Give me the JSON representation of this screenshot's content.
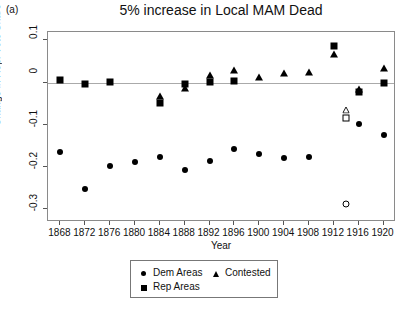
{
  "panel_label": "(a)",
  "chart_data": {
    "type": "scatter",
    "title": "5% increase in Local MAM Dead",
    "xlabel": "Year",
    "ylabel": "Change in Rep. Vote Share",
    "xlim": [
      1866,
      1922
    ],
    "ylim": [
      -0.33,
      0.12
    ],
    "xticks": [
      1868,
      1872,
      1876,
      1880,
      1884,
      1888,
      1892,
      1896,
      1900,
      1904,
      1908,
      1912,
      1916,
      1920
    ],
    "yticks": [
      0.1,
      0,
      -0.1,
      -0.2,
      -0.3
    ],
    "ytick_labels": [
      "0.1",
      "0",
      "-0.1",
      "-0.2",
      "-0.3"
    ],
    "grid": false,
    "zero_reference_line": 0,
    "legend_position": "bottom-center",
    "series": [
      {
        "name": "Dem Areas",
        "marker": "circle",
        "filled": true,
        "color": "#000000",
        "x": [
          1868,
          1872,
          1876,
          1880,
          1884,
          1888,
          1892,
          1896,
          1900,
          1904,
          1908,
          1916,
          1920
        ],
        "y": [
          -0.165,
          -0.253,
          -0.198,
          -0.188,
          -0.175,
          -0.207,
          -0.185,
          -0.157,
          -0.168,
          -0.178,
          -0.177,
          -0.098,
          -0.123
        ]
      },
      {
        "name": "Rep Areas",
        "marker": "square",
        "filled": true,
        "color": "#000000",
        "x": [
          1868,
          1872,
          1876,
          1884,
          1888,
          1892,
          1896,
          1912,
          1916,
          1920
        ],
        "y": [
          0.006,
          -0.003,
          0.002,
          -0.047,
          -0.003,
          0.001,
          0.005,
          0.088,
          -0.023,
          0.0
        ]
      },
      {
        "name": "Contested",
        "marker": "triangle",
        "filled": true,
        "color": "#000000",
        "x": [
          1884,
          1888,
          1892,
          1896,
          1900,
          1904,
          1908,
          1912,
          1916,
          1920
        ],
        "y": [
          -0.032,
          -0.012,
          0.018,
          0.031,
          0.014,
          0.024,
          0.026,
          0.068,
          -0.014,
          0.035
        ]
      },
      {
        "name": "Open markers (1914)",
        "marker": "open",
        "filled": false,
        "color": "#000000",
        "points": [
          {
            "x": 1914,
            "y": -0.048,
            "marker": "triangle"
          },
          {
            "x": 1914,
            "y": -0.083,
            "marker": "square"
          },
          {
            "x": 1914,
            "y": -0.287,
            "marker": "circle"
          }
        ]
      }
    ],
    "legend": [
      {
        "label": "Dem Areas",
        "marker": "circle"
      },
      {
        "label": "Contested",
        "marker": "triangle"
      },
      {
        "label": "Rep Areas",
        "marker": "square"
      }
    ]
  }
}
